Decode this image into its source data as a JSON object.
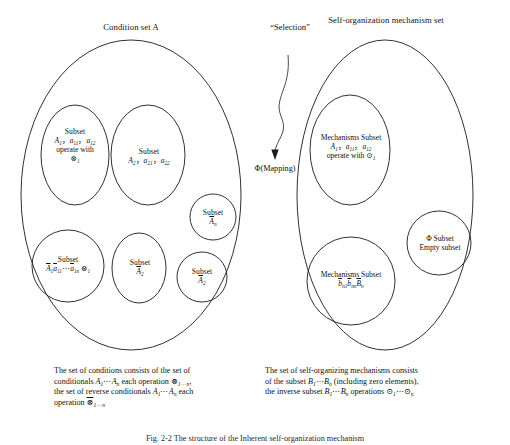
{
  "figure": {
    "background": "#ffffff",
    "stroke": "#1a1a1a",
    "left_set": {
      "title": "Condition set A",
      "nodes": [
        {
          "name": "subset-a1",
          "lines": [
            "Subset",
            "A₁，a₁₁，a₁₂",
            "operate with",
            "⊗₁"
          ]
        },
        {
          "name": "subset-a2",
          "lines": [
            "Subset",
            "A₂，a₂₁，a₂₂"
          ]
        },
        {
          "name": "subset-an-bar",
          "lines": [
            "Subset",
            "A̅ₙ"
          ]
        },
        {
          "name": "subset-a2-bar-small",
          "lines": [
            "Subset",
            "A̅₂"
          ]
        },
        {
          "name": "subset-a1-bar-series",
          "lines": [
            "Subset",
            "A̅1a̅11⋯a̅1n ⊗₁"
          ]
        },
        {
          "name": "subset-a2-bar",
          "lines": [
            "Subset",
            "A̅₂"
          ]
        }
      ],
      "caption": [
        "The set of conditions consists of the set of",
        "conditionals A₁⋯Aₙ each operation ⊗₁⋯ₙ,",
        "the set of reverse conditionals A₁⋯Aₙ each",
        "operation ⊗̅₁⋯ₙ"
      ]
    },
    "middle": {
      "selection_label": "“Selection”",
      "mapping_label": "Φ(Mapping)",
      "arrow": "curved-down-arrow"
    },
    "right_set": {
      "title_lines": [
        "Self-organization",
        "mechanism set"
      ],
      "nodes": [
        {
          "name": "mechanisms-subset-a1",
          "lines": [
            "Mechanisms Subset",
            "A₁，a₁₁，a₁₂",
            "operate with ⊙₁"
          ]
        },
        {
          "name": "mechanisms-subset-bn",
          "lines": [
            "Mechanisms Subset",
            "b̅ₙ₁b̅ₙₙB̅ₙ"
          ]
        },
        {
          "name": "phi-empty-subset",
          "lines": [
            "Φ Subset",
            "Empty subset"
          ]
        }
      ],
      "caption": [
        "The set of self-organizing mechanisms consists",
        "of the subset B₁⋯Bₙ (including zero elements),",
        "the inverse subset B₁⋯Bₙ operations ⊙₁⋯⊙ₙ"
      ]
    },
    "figure_caption": "Fig. 2-2  The structure of the Inherent self-organization mechanism"
  }
}
